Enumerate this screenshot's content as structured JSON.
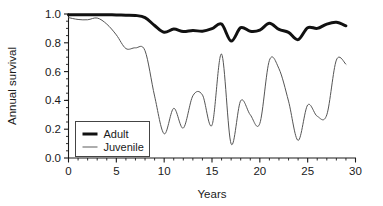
{
  "chart_data": {
    "type": "line",
    "title": "",
    "xlabel": "Years",
    "ylabel": "Annual survival",
    "xlim": [
      0,
      30
    ],
    "ylim": [
      0.0,
      1.0
    ],
    "grid": false,
    "legend_position": "lower-left-inside",
    "x_ticks_major": [
      0,
      5,
      10,
      15,
      20,
      25,
      30
    ],
    "x_tick_labels": [
      "0",
      "5",
      "10",
      "15",
      "20",
      "25",
      "30"
    ],
    "x_tick_minor_step": 1,
    "y_ticks_major": [
      0.0,
      0.2,
      0.4,
      0.6,
      0.8,
      1.0
    ],
    "y_tick_labels": [
      "0.0",
      "0.2",
      "0.4",
      "0.6",
      "0.8",
      "1.0"
    ],
    "y_tick_minor_step": 0.05,
    "x": [
      0,
      1,
      2,
      3,
      4,
      5,
      6,
      7,
      8,
      9,
      10,
      11,
      12,
      13,
      14,
      15,
      16,
      17,
      18,
      19,
      20,
      21,
      22,
      23,
      24,
      25,
      26,
      27,
      28,
      29
    ],
    "series": [
      {
        "name": "Adult",
        "color": "#111111",
        "line_width": 3.0,
        "values": [
          0.995,
          0.995,
          0.995,
          0.995,
          0.995,
          0.993,
          0.992,
          0.99,
          0.975,
          0.92,
          0.873,
          0.895,
          0.878,
          0.886,
          0.88,
          0.898,
          0.93,
          0.812,
          0.905,
          0.88,
          0.888,
          0.935,
          0.893,
          0.872,
          0.822,
          0.905,
          0.9,
          0.93,
          0.942,
          0.918
        ]
      },
      {
        "name": "Juvenile",
        "color": "#555555",
        "line_width": 1.0,
        "values": [
          0.975,
          0.962,
          0.96,
          0.972,
          0.93,
          0.855,
          0.76,
          0.765,
          0.745,
          0.43,
          0.168,
          0.345,
          0.208,
          0.432,
          0.438,
          0.228,
          0.722,
          0.098,
          0.398,
          0.3,
          0.24,
          0.678,
          0.62,
          0.395,
          0.122,
          0.368,
          0.29,
          0.3,
          0.68,
          0.65
        ]
      }
    ]
  },
  "legend": {
    "items": [
      {
        "label": "Adult"
      },
      {
        "label": "Juvenile"
      }
    ]
  }
}
